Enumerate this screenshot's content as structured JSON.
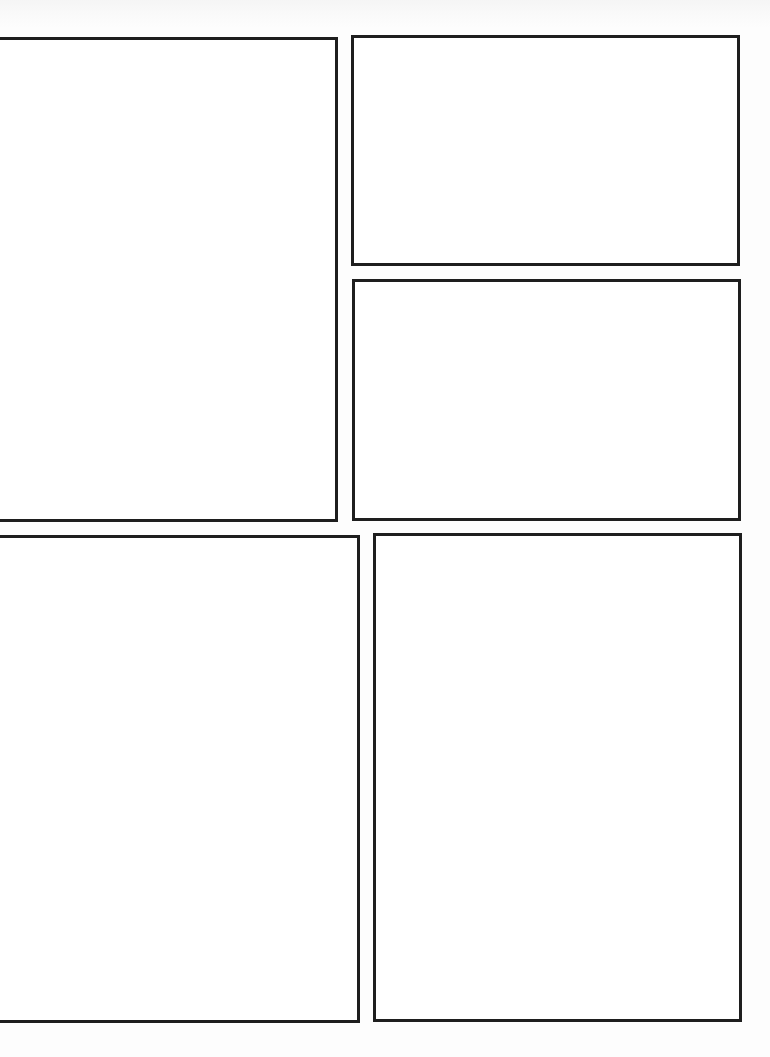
{
  "page": {
    "type": "blank comic page template",
    "background": "#fdfdfd",
    "border_color": "#1e1e1e"
  },
  "panels": [
    {
      "id": 1,
      "label": "",
      "left": -4,
      "top": 37,
      "width": 342,
      "height": 485
    },
    {
      "id": 2,
      "label": "",
      "left": 351,
      "top": 35,
      "width": 389,
      "height": 231
    },
    {
      "id": 3,
      "label": "",
      "left": 352,
      "top": 279,
      "width": 389,
      "height": 242
    },
    {
      "id": 4,
      "label": "",
      "left": -4,
      "top": 535,
      "width": 364,
      "height": 488
    },
    {
      "id": 5,
      "label": "",
      "left": 373,
      "top": 533,
      "width": 369,
      "height": 489
    }
  ]
}
